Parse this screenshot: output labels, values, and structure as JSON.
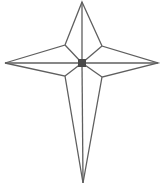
{
  "diagram": {
    "title": "",
    "shape": "four-pointed-star",
    "stroke_color": "#5f5f5f",
    "center_fill": "#4a4a4a",
    "background": "#ffffff",
    "points": {
      "top": [
        82,
        2
      ],
      "right": [
        158,
        63
      ],
      "bottom": [
        83,
        183
      ],
      "left": [
        5,
        63
      ],
      "inner_upper_left": [
        65,
        45
      ],
      "inner_upper_right": [
        102,
        46
      ],
      "inner_lower_right": [
        102,
        77
      ],
      "inner_lower_left": [
        65,
        76
      ],
      "center": [
        82,
        63
      ]
    },
    "center_square_size": 8
  }
}
